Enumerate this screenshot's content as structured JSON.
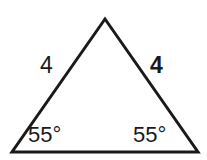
{
  "figure": {
    "type": "geometry-diagram",
    "shape": "isosceles-triangle",
    "background_color": "#ffffff",
    "stroke_color": "#1a1a1a",
    "stroke_width": 3,
    "width": 207,
    "height": 160,
    "vertices": {
      "apex": {
        "x": 105,
        "y": 19
      },
      "bottom_left": {
        "x": 12,
        "y": 152
      },
      "bottom_right": {
        "x": 198,
        "y": 152
      }
    },
    "labels": {
      "side_left": {
        "text": "4",
        "weight": "regular"
      },
      "side_right": {
        "text": "4",
        "weight": "bold"
      },
      "angle_left": {
        "text": "55°",
        "weight": "regular"
      },
      "angle_right": {
        "text": "55°",
        "weight": "regular"
      }
    }
  }
}
